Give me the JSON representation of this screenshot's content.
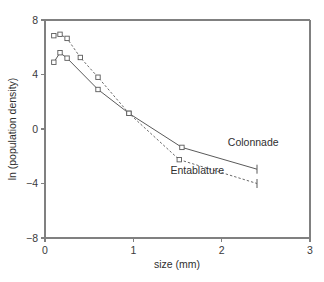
{
  "chart_data": {
    "type": "line",
    "title": "",
    "xlabel": "size (mm)",
    "ylabel": "ln (population density)",
    "xlim": [
      0,
      3
    ],
    "ylim": [
      -8,
      8
    ],
    "xticks": [
      0,
      1,
      2,
      3
    ],
    "xtick_labels": [
      "0",
      "1",
      "2",
      "3"
    ],
    "yticks": [
      8,
      4,
      0,
      -4,
      -8
    ],
    "ytick_labels": [
      "8",
      "4",
      "0",
      "−4",
      "−8"
    ],
    "grid": false,
    "legend_position": "inline-annotation",
    "series": [
      {
        "name": "Colonnade",
        "style": "solid",
        "marker": "open-square",
        "label_x": 2.07,
        "label_y": -1.25,
        "end_cap": true,
        "points": [
          {
            "x": 0.1,
            "y": 4.9
          },
          {
            "x": 0.17,
            "y": 5.6
          },
          {
            "x": 0.25,
            "y": 5.2
          },
          {
            "x": 0.6,
            "y": 2.9
          },
          {
            "x": 0.95,
            "y": 1.15
          },
          {
            "x": 1.55,
            "y": -1.35
          },
          {
            "x": 2.4,
            "y": -2.95
          }
        ]
      },
      {
        "name": "Entablature",
        "style": "dashed",
        "marker": "open-square",
        "label_x": 1.42,
        "label_y": -3.3,
        "end_cap": true,
        "points": [
          {
            "x": 0.1,
            "y": 6.85
          },
          {
            "x": 0.17,
            "y": 6.95
          },
          {
            "x": 0.25,
            "y": 6.65
          },
          {
            "x": 0.4,
            "y": 5.25
          },
          {
            "x": 0.6,
            "y": 3.8
          },
          {
            "x": 0.95,
            "y": 1.15
          },
          {
            "x": 1.52,
            "y": -2.25
          },
          {
            "x": 2.4,
            "y": -4.0
          }
        ]
      }
    ]
  },
  "plot_geometry": {
    "left_px": 45,
    "right_px": 310,
    "top_px": 20,
    "bottom_px": 238
  }
}
